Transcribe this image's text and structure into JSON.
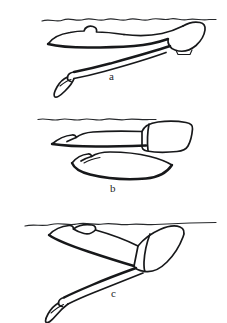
{
  "figure": {
    "background_color": "#ffffff",
    "ink_color": "#17181a",
    "width": 227,
    "height": 323,
    "panel_count": 3
  },
  "panels": [
    {
      "id": "a",
      "label": "a",
      "label_position": {
        "x": 109,
        "y": 71
      },
      "caption": "Streamlined prone glide just below the surface, legs extended back and down",
      "waterline": {
        "name": "water-surface-line",
        "style": "wavy",
        "x_start": 42,
        "x_end": 216,
        "y": 20
      },
      "body_orientation": "near-horizontal, head left, feet lower-left, hips right",
      "elements": [
        "head-and-arms-outline",
        "torso-outline",
        "leg-outline",
        "foot-outline",
        "hip-shorts-outline"
      ]
    },
    {
      "id": "b",
      "label": "b",
      "label_position": {
        "x": 110,
        "y": 183
      },
      "caption": "Flat prone position with both legs held horizontally, one leg above the other",
      "waterline": {
        "name": "water-surface-line",
        "style": "wavy",
        "x_start": 38,
        "x_end": 156,
        "y": 119
      },
      "body_orientation": "horizontal, head left, hips right with shorts block",
      "elements": [
        "upper-leg-outline",
        "lower-leg-outline",
        "foot-outline",
        "hip-shorts-outline"
      ]
    },
    {
      "id": "c",
      "label": "c",
      "label_position": {
        "x": 111,
        "y": 288
      },
      "caption": "Inclined pike/dive position, torso angled down from the surface with legs up toward the surface",
      "waterline": {
        "name": "water-surface-line",
        "style": "wavy",
        "x_start": 25,
        "x_end": 216,
        "y": 224
      },
      "body_orientation": "diagonal, legs at upper-left near surface, hips upper-right, feet lower-left",
      "elements": [
        "leg-outline",
        "torso-outline",
        "foot-outline",
        "hip-shorts-outline"
      ]
    }
  ]
}
